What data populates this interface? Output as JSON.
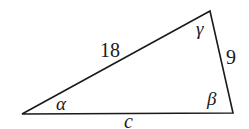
{
  "figure": {
    "type": "triangle",
    "vertices": {
      "A": {
        "x": 22,
        "y": 114,
        "angle_label": "α"
      },
      "B": {
        "x": 233,
        "y": 113,
        "angle_label": "β"
      },
      "C": {
        "x": 210,
        "y": 11,
        "angle_label": "γ"
      }
    },
    "sides": {
      "AC": {
        "label": "18"
      },
      "BC": {
        "label": "9"
      },
      "AB": {
        "label": "c"
      }
    },
    "stroke_color": "#1a1a1a",
    "background": "#ffffff"
  }
}
